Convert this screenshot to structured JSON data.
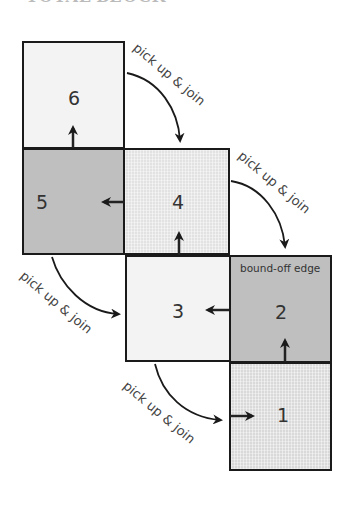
{
  "title": "TOTAL BLOCK",
  "squares": [
    {
      "id": "1",
      "label": "1",
      "shade": "grid"
    },
    {
      "id": "2",
      "label": "2",
      "shade": "dark",
      "edge_note": "bound-off edge"
    },
    {
      "id": "3",
      "label": "3",
      "shade": "light"
    },
    {
      "id": "4",
      "label": "4",
      "shade": "grid"
    },
    {
      "id": "5",
      "label": "5",
      "shade": "dark"
    },
    {
      "id": "6",
      "label": "6",
      "shade": "light"
    }
  ],
  "connectors": [
    {
      "from": "6",
      "to": "4",
      "label": "pick up & join"
    },
    {
      "from": "4",
      "to": "2",
      "label": "pick up & join"
    },
    {
      "from": "5",
      "to": "3",
      "label": "pick up & join"
    },
    {
      "from": "3",
      "to": "1",
      "label": "pick up & join"
    }
  ],
  "colors": {
    "outline": "#1a1a1a",
    "dark_fill": "#bfbfbf",
    "light_fill": "#f3f3f3",
    "grid_fill": "#e2e2e2"
  }
}
